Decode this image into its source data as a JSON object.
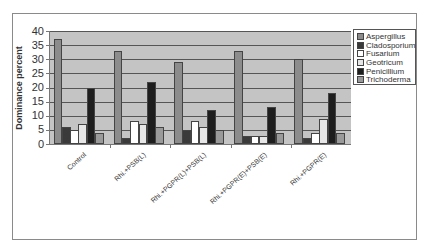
{
  "chart_data": {
    "type": "bar",
    "title": "",
    "xlabel": "",
    "ylabel": "Dominance percent",
    "ylim": [
      0,
      40
    ],
    "yticks": [
      0,
      5,
      10,
      15,
      20,
      25,
      30,
      35,
      40
    ],
    "grid": true,
    "legend_position": "right",
    "categories": [
      "Control",
      "Rhi.+PSB(L)",
      "Rhi.+PGPR(L)+PSB(L)",
      "Rhi.+PGPR(E)+PSB(E)",
      "Rhi.+PGPR(E)"
    ],
    "series": [
      {
        "name": "Aspergillus",
        "color": "#8c8c8c",
        "values": [
          37,
          33,
          29,
          33,
          30
        ]
      },
      {
        "name": "Cladosporium",
        "color": "#3a3a3a",
        "values": [
          6,
          2,
          5,
          3,
          2
        ]
      },
      {
        "name": "Fusarium",
        "color": "#ffffff",
        "values": [
          5,
          8,
          8,
          3,
          4
        ]
      },
      {
        "name": "Geotricum",
        "color": "#e6e6e6",
        "values": [
          7,
          7,
          6,
          3,
          9
        ]
      },
      {
        "name": "Penicillium",
        "color": "#1e1e1e",
        "values": [
          20,
          22,
          12,
          13,
          18
        ]
      },
      {
        "name": "Trichoderma",
        "color": "#9a9a9a",
        "values": [
          4,
          6,
          5,
          4,
          4
        ]
      }
    ]
  }
}
